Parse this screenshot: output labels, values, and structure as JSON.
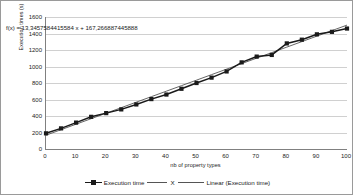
{
  "chart_data": {
    "type": "line",
    "title": "",
    "xlabel": "nb of property types",
    "ylabel": "Execution times (s)",
    "xlim": [
      0,
      100
    ],
    "ylim": [
      0,
      1600
    ],
    "xticks": [
      0,
      10,
      20,
      30,
      40,
      50,
      60,
      70,
      80,
      90,
      100
    ],
    "yticks": [
      0,
      200,
      400,
      600,
      800,
      1000,
      1200,
      1400,
      1600
    ],
    "grid": "horizontal",
    "legend_position": "bottom",
    "annotation": "f(x) = 13,3457584415584 x + 167,266887445888",
    "x": [
      0,
      5,
      10,
      15,
      20,
      25,
      30,
      35,
      40,
      45,
      50,
      55,
      60,
      65,
      70,
      75,
      80,
      85,
      90,
      95,
      100
    ],
    "series": [
      {
        "name": "Execution time",
        "marker": "square",
        "color": "#1a1a1a",
        "values": [
          190,
          250,
          320,
          390,
          435,
          480,
          540,
          605,
          660,
          730,
          800,
          865,
          940,
          1050,
          1120,
          1140,
          1280,
          1325,
          1390,
          1420,
          1460
        ]
      },
      {
        "name": "Linear (Execution time)",
        "marker": "none",
        "color": "#555555",
        "trendline": true,
        "slope": 13.3457584415584,
        "intercept": 167.266887445888,
        "values": [
          167.3,
          234.0,
          300.7,
          367.5,
          434.2,
          500.9,
          567.7,
          634.4,
          701.1,
          767.8,
          834.6,
          901.3,
          968.0,
          1034.7,
          1101.5,
          1168.2,
          1234.9,
          1301.6,
          1368.4,
          1435.1,
          1501.8
        ]
      }
    ],
    "legend": [
      {
        "label": "Execution time"
      },
      {
        "label": "X"
      },
      {
        "label": "Linear (Execution time)"
      }
    ]
  },
  "colors": {
    "series": "#1a1a1a",
    "trendline": "#555555",
    "grid": "#d0d0d0",
    "axis": "#808080",
    "border": "#9a9a9a",
    "text": "#242424",
    "background": "#ffffff"
  }
}
